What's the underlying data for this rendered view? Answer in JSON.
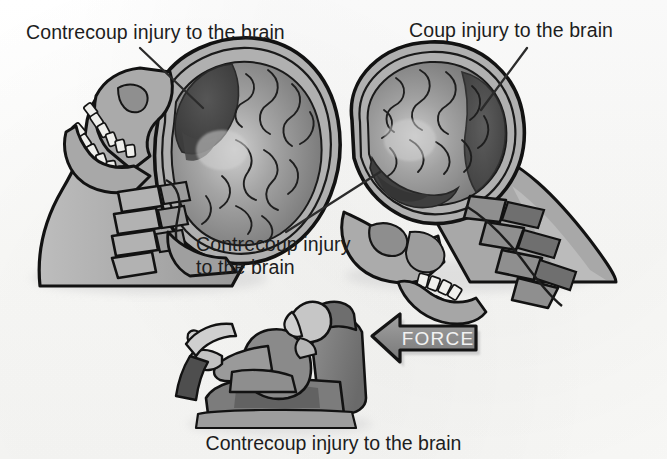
{
  "figure": {
    "type": "anatomical-diagram",
    "style": "grayscale scanned medical illustration",
    "background_color": "#fbfbfa",
    "ink_color": "#1d1d1d"
  },
  "labels": {
    "contrecoup_left": "Contrecoup injury to the brain",
    "coup_right": "Coup injury to the brain",
    "contrecoup_middle": "Contrecoup injury\nto the brain",
    "caption_bottom": "Contrecoup injury to the brain"
  },
  "arrow": {
    "label": "FORCE",
    "direction": "left",
    "fill_color": "#8c8c8c",
    "outline_color": "#141414",
    "text_color": "#f2f2f2"
  },
  "panels": [
    {
      "id": "left-head",
      "name": "Sagittal head section, upright, facing left",
      "injury_site": "contrecoup",
      "injury_location": "anterior-superior brain, opposite the impact",
      "leader_line": "from label down-right to dark brain region"
    },
    {
      "id": "right-head",
      "name": "Sagittal head section, extended backward, facing left",
      "injury_sites": [
        "coup",
        "contrecoup"
      ],
      "coup_location": "posterior-superior brain at the point of impact",
      "contrecoup_location": "anterior-inferior brain, opposite the impact"
    },
    {
      "id": "driver",
      "name": "Seated occupant in vehicle seat, side view",
      "detail": "Driver gripping steering wheel, head against head restraint"
    }
  ],
  "palette": {
    "skin": "#b7b7b7",
    "skin_shadow": "#9a9a9a",
    "bone": "#adadad",
    "bone_light": "#d8d8d8",
    "tooth": "#f0f0ee",
    "brain": "#7d7d7d",
    "brain_light": "#a9a9a9",
    "brain_highlight": "#c9c9c9",
    "injury_dark": "#4a4a4a",
    "injury_darker": "#3a3a3a",
    "outline": "#121212",
    "seat": "#767676",
    "seat_dark": "#5a5a5a",
    "leader_line": "#2a2a2a"
  }
}
